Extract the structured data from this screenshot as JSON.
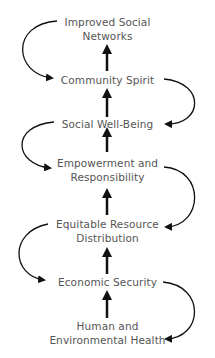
{
  "diagram": {
    "type": "flow",
    "direction": "bottom-to-top",
    "nodes": [
      {
        "id": "n1",
        "line1": "Improved Social",
        "line2": "Networks"
      },
      {
        "id": "n2",
        "line1": "Community Spirit",
        "line2": ""
      },
      {
        "id": "n3",
        "line1": "Social Well-Being",
        "line2": ""
      },
      {
        "id": "n4",
        "line1": "Empowerment and",
        "line2": "Responsibility"
      },
      {
        "id": "n5",
        "line1": "Equitable Resource",
        "line2": "Distribution"
      },
      {
        "id": "n6",
        "line1": "Economic Security",
        "line2": ""
      },
      {
        "id": "n7",
        "line1": "Human and",
        "line2": "Environmental Health"
      }
    ],
    "edges": [
      {
        "from": "n7",
        "to": "n6",
        "style": "straight-up"
      },
      {
        "from": "n6",
        "to": "n5",
        "style": "straight-up"
      },
      {
        "from": "n5",
        "to": "n4",
        "style": "straight-up"
      },
      {
        "from": "n4",
        "to": "n3",
        "style": "straight-up"
      },
      {
        "from": "n3",
        "to": "n2",
        "style": "straight-up"
      },
      {
        "from": "n2",
        "to": "n1",
        "style": "straight-up"
      },
      {
        "from": "n1",
        "to": "n2",
        "style": "curved-left-down"
      },
      {
        "from": "n2",
        "to": "n3",
        "style": "curved-right-down"
      },
      {
        "from": "n3",
        "to": "n4",
        "style": "curved-left-down"
      },
      {
        "from": "n4",
        "to": "n5",
        "style": "curved-right-down"
      },
      {
        "from": "n5",
        "to": "n6",
        "style": "curved-left-down"
      },
      {
        "from": "n6",
        "to": "n7",
        "style": "curved-right-down"
      }
    ],
    "colors": {
      "text": "#555555",
      "arrow": "#111111"
    }
  }
}
